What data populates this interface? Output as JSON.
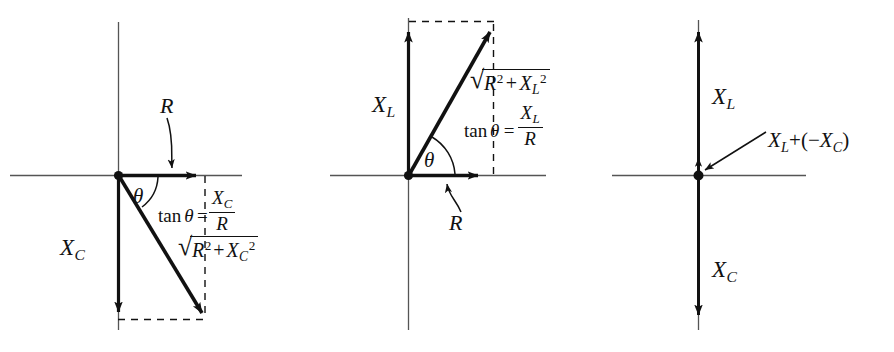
{
  "figure": {
    "kind": "phasor-diagram-set",
    "count": 3,
    "background_color": "#ffffff",
    "ink_color": "#111111",
    "axis_color": "#555555"
  },
  "diagram_1": {
    "name": "series-RC-impedance-phasor",
    "labels": {
      "resistance": "R",
      "reactance": "X",
      "reactance_sub": "C",
      "angle": "θ"
    },
    "tan_formula": {
      "lhs_fn": "tan",
      "lhs_arg": "θ",
      "equals": "=",
      "numerator": "X",
      "numerator_sub": "C",
      "denominator": "R"
    },
    "magnitude": {
      "radical_sign": "√",
      "term1": "R",
      "term1_sup": "2",
      "plus": "+",
      "term2": "X",
      "term2_sub": "C",
      "term2_sup": "2"
    }
  },
  "diagram_2": {
    "name": "series-RL-impedance-phasor",
    "labels": {
      "resistance": "R",
      "reactance": "X",
      "reactance_sub": "L",
      "angle": "θ"
    },
    "tan_formula": {
      "lhs_fn": "tan",
      "lhs_arg": "θ",
      "equals": "=",
      "numerator": "X",
      "numerator_sub": "L",
      "denominator": "R"
    },
    "magnitude": {
      "radical_sign": "√",
      "term1": "R",
      "term1_sup": "2",
      "plus": "+",
      "term2": "X",
      "term2_sub": "L",
      "term2_sup": "2"
    }
  },
  "diagram_3": {
    "name": "net-reactance-phasor",
    "labels": {
      "inductive": "X",
      "inductive_sub": "L",
      "capacitive": "X",
      "capacitive_sub": "C"
    },
    "sum_label": {
      "term1": "X",
      "term1_sub": "L",
      "plus": "+",
      "open_paren": "(",
      "minus": "−",
      "term2": "X",
      "term2_sub": "C",
      "close_paren": ")"
    }
  }
}
